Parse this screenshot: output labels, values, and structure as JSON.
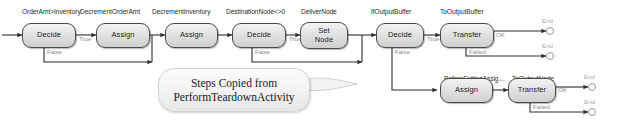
{
  "diagram": {
    "nodes": [
      {
        "id": "n1",
        "title": "OrderAmt>Inventory",
        "label": "Decide"
      },
      {
        "id": "n2",
        "title": "DecrementOrderAmt",
        "label": "Assign"
      },
      {
        "id": "n3",
        "title": "DecrementInventory",
        "label": "Assign"
      },
      {
        "id": "n4",
        "title": "DestinationNode<>0",
        "label": "Decide"
      },
      {
        "id": "n5",
        "title": "DeliverNode",
        "label": "Set\nNode"
      },
      {
        "id": "n6",
        "title": "IfOutputBuffer",
        "label": "Decide"
      },
      {
        "id": "n7",
        "title": "ToOutputBuffer",
        "label": "Transfer"
      },
      {
        "id": "n8",
        "title": "BeforeExitingAssig…",
        "label": "Assign"
      },
      {
        "id": "n9",
        "title": "ToOutputNode",
        "label": "Transfer"
      }
    ],
    "edge_labels": [
      {
        "id": "e1",
        "text": "True"
      },
      {
        "id": "e2",
        "text": "False"
      },
      {
        "id": "e3",
        "text": "True"
      },
      {
        "id": "e4",
        "text": "False"
      },
      {
        "id": "e5",
        "text": "True"
      },
      {
        "id": "e6",
        "text": "False"
      },
      {
        "id": "e7",
        "text": "OK"
      },
      {
        "id": "e8",
        "text": "Failed"
      },
      {
        "id": "e9",
        "text": "OK"
      },
      {
        "id": "e10",
        "text": "Failed"
      }
    ],
    "terminators": [
      {
        "id": "t1",
        "label": "End"
      },
      {
        "id": "t2",
        "label": "End"
      },
      {
        "id": "t3",
        "label": "End"
      },
      {
        "id": "t4",
        "label": "End"
      }
    ],
    "callout": {
      "line1": "Steps Copied from",
      "line2": "PerformTeardownActivity"
    },
    "colors": {
      "node_border": "#4a4a4a",
      "node_fill_top": "#f3f3f3",
      "node_fill_bottom": "#cfcfcf",
      "wire": "#2e2e2e",
      "edge_label": "#8a8a8a",
      "terminator": "#9d9d9d",
      "background": "#ffffff"
    }
  }
}
